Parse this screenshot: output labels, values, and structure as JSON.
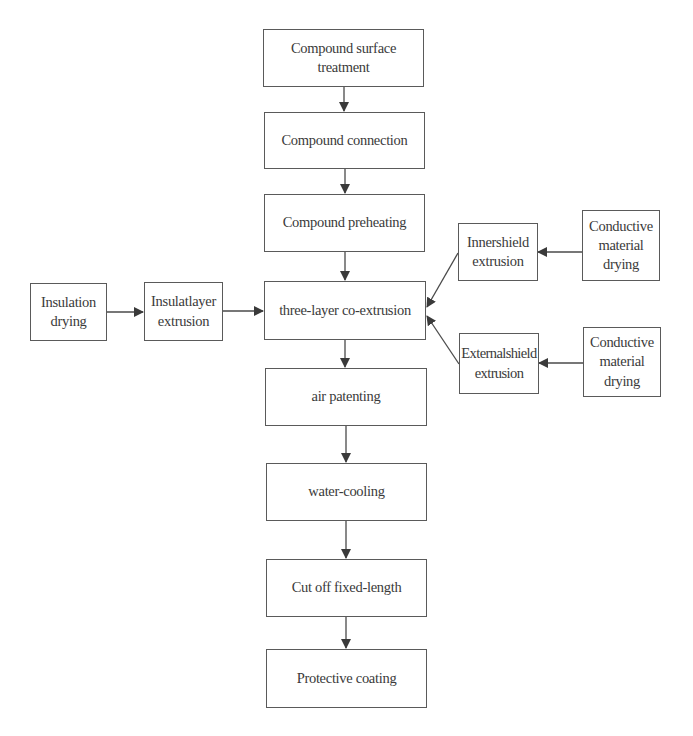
{
  "diagram": {
    "type": "flowchart",
    "colors": {
      "background": "#ffffff",
      "box_border": "#5a5a5a",
      "line": "#4a4a4a",
      "text": "#3a3a3a"
    },
    "nodes": {
      "surface_treatment": {
        "label": "Compound surface treatment"
      },
      "connection": {
        "label": "Compound connection"
      },
      "preheating": {
        "label": "Compound preheating"
      },
      "coextrusion": {
        "label": "three-layer co-extrusion"
      },
      "air_patenting": {
        "label": "air patenting"
      },
      "water_cooling": {
        "label": "water-cooling"
      },
      "cut_off": {
        "label": "Cut off fixed-length"
      },
      "protective_coating": {
        "label": "Protective coating"
      },
      "insulation_drying": {
        "label_line1": "Insulation",
        "label_line2": "drying"
      },
      "insulatlayer_extrusion": {
        "label_line1": "Insulatlayer",
        "label_line2": "extrusion"
      },
      "innershield_extrusion": {
        "label_line1": "Innershield",
        "label_line2": "extrusion"
      },
      "externalshield_extrusion": {
        "label_line1": "Externalshield",
        "label_line2": "extrusion"
      },
      "conductive_drying_1": {
        "label_line1": "Conductive",
        "label_line2": "material",
        "label_line3": "drying"
      },
      "conductive_drying_2": {
        "label_line1": "Conductive",
        "label_line2": "material",
        "label_line3": "drying"
      }
    },
    "edges": [
      {
        "from": "Compound surface treatment",
        "to": "Compound connection"
      },
      {
        "from": "Compound connection",
        "to": "Compound preheating"
      },
      {
        "from": "Compound preheating",
        "to": "three-layer co-extrusion"
      },
      {
        "from": "Insulation drying",
        "to": "Insulatlayer extrusion"
      },
      {
        "from": "Insulatlayer extrusion",
        "to": "three-layer co-extrusion"
      },
      {
        "from": "Conductive material drying (1)",
        "to": "Innershield extrusion"
      },
      {
        "from": "Innershield extrusion",
        "to": "three-layer co-extrusion"
      },
      {
        "from": "Conductive material drying (2)",
        "to": "Externalshield extrusion"
      },
      {
        "from": "Externalshield extrusion",
        "to": "three-layer co-extrusion"
      },
      {
        "from": "three-layer co-extrusion",
        "to": "air patenting"
      },
      {
        "from": "air patenting",
        "to": "water-cooling"
      },
      {
        "from": "water-cooling",
        "to": "Cut off fixed-length"
      },
      {
        "from": "Cut off fixed-length",
        "to": "Protective coating"
      }
    ]
  }
}
